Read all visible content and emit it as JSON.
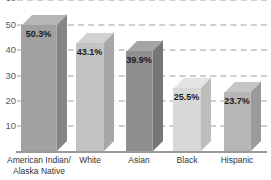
{
  "chart_data": {
    "type": "bar",
    "title": "",
    "xlabel": "",
    "ylabel": "",
    "categories": [
      {
        "lines": [
          "American Indian/",
          "Alaska Native"
        ]
      },
      {
        "lines": [
          "White",
          ""
        ]
      },
      {
        "lines": [
          "Asian",
          ""
        ]
      },
      {
        "lines": [
          "Black",
          ""
        ]
      },
      {
        "lines": [
          "Hispanic",
          ""
        ]
      }
    ],
    "values": [
      50.3,
      43.1,
      39.9,
      25.5,
      23.7
    ],
    "value_labels": [
      "50.3%",
      "43.1%",
      "39.9%",
      "25.5%",
      "23.7%"
    ],
    "y_ticks": [
      "60",
      "50",
      "40",
      "30",
      "20",
      "10"
    ],
    "ylim": [
      0,
      60
    ],
    "grid": "dashed-horizontal",
    "legend": "none",
    "style": "3d-extruded-bars",
    "bar_colors": [
      {
        "front": "#a1a1a1",
        "top": "#b6b6b6",
        "side": "#858585"
      },
      {
        "front": "#c3c3c3",
        "top": "#d1d1d1",
        "side": "#a7a7a7"
      },
      {
        "front": "#8f8f8f",
        "top": "#a4a4a4",
        "side": "#767676"
      },
      {
        "front": "#d8d8d8",
        "top": "#e4e4e4",
        "side": "#bdbdbd"
      },
      {
        "front": "#b6b6b6",
        "top": "#c5c5c5",
        "side": "#9b9b9b"
      }
    ],
    "colors": {
      "background": "#ffffff",
      "gridline": "#cfcfcf",
      "baseline": "#9a9a9a",
      "tick_text": "#5a5a5a",
      "category_text": "#333333",
      "value_text": "#1a1a1a"
    }
  }
}
